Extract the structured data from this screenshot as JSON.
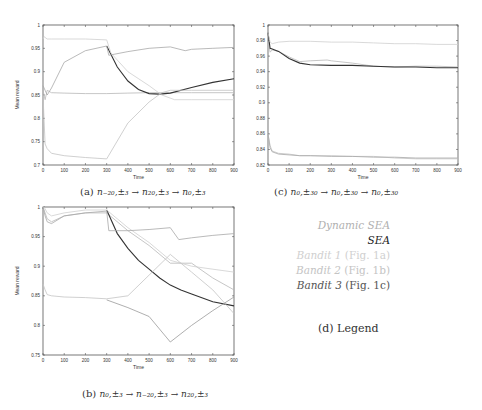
{
  "chart_data": [
    {
      "id": "a",
      "type": "line",
      "caption_label": "(a)",
      "caption_math": "n−20,±3 → n20,±3 → n0,±3",
      "xlabel": "Time",
      "ylabel": "Mean reward",
      "xlim": [
        0,
        900
      ],
      "ylim": [
        0.7,
        1.0
      ],
      "xticks": [
        "0",
        "100",
        "200",
        "300",
        "400",
        "500",
        "600",
        "700",
        "800",
        "900"
      ],
      "yticks": [
        "0.7",
        "0.75",
        "0.8",
        "0.85",
        "0.9",
        "0.95",
        "1"
      ],
      "grid": false,
      "series": [
        {
          "name": "Dynamic SEA",
          "color": "#b8b8b8",
          "x": [
            0,
            10,
            20,
            40,
            100,
            200,
            300,
            400,
            500,
            620,
            700,
            900
          ],
          "y": [
            0.86,
            0.84,
            0.86,
            0.855,
            0.854,
            0.853,
            0.853,
            0.854,
            0.855,
            0.855,
            0.855,
            0.855
          ]
        },
        {
          "name": "SEA",
          "color": "#333333",
          "x": [
            300,
            350,
            400,
            450,
            500,
            550,
            600,
            700,
            800,
            900
          ],
          "y": [
            0.955,
            0.91,
            0.88,
            0.862,
            0.853,
            0.852,
            0.854,
            0.866,
            0.877,
            0.885
          ]
        },
        {
          "name": "Bandit 1 (Fig. 1a)",
          "color": "#cfcfcf",
          "x": [
            0,
            5,
            20,
            40,
            100,
            200,
            300,
            320,
            400,
            500,
            560,
            620,
            700,
            800,
            900
          ],
          "y": [
            0.97,
            0.975,
            0.97,
            0.97,
            0.97,
            0.97,
            0.968,
            0.94,
            0.9,
            0.87,
            0.85,
            0.84,
            0.84,
            0.84,
            0.84
          ]
        },
        {
          "name": "Bandit 2 (Fig. 1b)",
          "color": "#c4c4c4",
          "x": [
            0,
            10,
            20,
            40,
            100,
            200,
            300,
            400,
            500,
            560,
            600,
            700,
            800,
            900
          ],
          "y": [
            0.85,
            0.745,
            0.735,
            0.725,
            0.72,
            0.716,
            0.713,
            0.79,
            0.835,
            0.855,
            0.86,
            0.86,
            0.86,
            0.86
          ]
        },
        {
          "name": "Bandit 3 (Fig. 1c)",
          "color": "#a8a8a8",
          "x": [
            0,
            10,
            20,
            40,
            100,
            200,
            300,
            310,
            400,
            500,
            600,
            670,
            700,
            800,
            900
          ],
          "y": [
            0.87,
            0.86,
            0.85,
            0.865,
            0.92,
            0.945,
            0.955,
            0.935,
            0.943,
            0.95,
            0.953,
            0.945,
            0.948,
            0.95,
            0.952
          ]
        }
      ]
    },
    {
      "id": "b",
      "type": "line",
      "caption_label": "(b)",
      "caption_math": "n0,±3 → n−20,±3 → n20,±3",
      "xlabel": "Time",
      "ylabel": "Mean reward",
      "xlim": [
        0,
        900
      ],
      "ylim": [
        0.75,
        1.0
      ],
      "xticks": [
        "0",
        "100",
        "200",
        "300",
        "400",
        "500",
        "600",
        "700",
        "800",
        "900"
      ],
      "yticks": [
        "0.75",
        "0.8",
        "0.85",
        "0.9",
        "0.95",
        "1"
      ],
      "grid": false,
      "series": [
        {
          "name": "Dynamic SEA",
          "color": "#b8b8b8",
          "x": [
            0,
            10,
            20,
            40,
            100,
            200,
            300,
            400,
            500,
            600,
            700,
            800,
            900
          ],
          "y": [
            1.0,
            0.99,
            0.98,
            0.975,
            0.985,
            0.99,
            0.99,
            0.96,
            0.935,
            0.905,
            0.905,
            0.88,
            0.86
          ]
        },
        {
          "name": "SEA",
          "color": "#333333",
          "x": [
            300,
            350,
            400,
            450,
            500,
            550,
            600,
            650,
            700,
            800,
            900
          ],
          "y": [
            0.995,
            0.955,
            0.93,
            0.91,
            0.895,
            0.88,
            0.868,
            0.86,
            0.853,
            0.84,
            0.833
          ]
        },
        {
          "name": "Bandit 1 (Fig. 1a)",
          "color": "#cfcfcf",
          "x": [
            0,
            5,
            20,
            40,
            100,
            200,
            300,
            350,
            400,
            500,
            600,
            700,
            800,
            900
          ],
          "y": [
            1.0,
            1.0,
            0.99,
            0.985,
            0.99,
            0.995,
            0.995,
            0.98,
            0.965,
            0.94,
            0.91,
            0.9,
            0.895,
            0.89
          ]
        },
        {
          "name": "Bandit 2 (Fig. 1b)",
          "color": "#c4c4c4",
          "x": [
            0,
            10,
            20,
            40,
            100,
            200,
            300,
            400,
            500,
            600,
            700,
            800,
            900
          ],
          "y": [
            0.87,
            0.86,
            0.852,
            0.85,
            0.848,
            0.847,
            0.845,
            0.85,
            0.885,
            0.92,
            0.89,
            0.86,
            0.82
          ]
        },
        {
          "name": "Bandit 3 (Fig. 1c)",
          "color": "#a8a8a8",
          "x": [
            0,
            10,
            20,
            40,
            100,
            200,
            300,
            310,
            400,
            500,
            600,
            640,
            700,
            800,
            900
          ],
          "y": [
            1.0,
            0.985,
            0.975,
            0.972,
            0.985,
            0.99,
            0.993,
            0.96,
            0.96,
            0.962,
            0.965,
            0.945,
            0.948,
            0.952,
            0.955
          ]
        },
        {
          "name": "Bandit 2 decline",
          "color": "#9a9a9a",
          "x": [
            300,
            400,
            500,
            600,
            700,
            800,
            900
          ],
          "y": [
            0.843,
            0.83,
            0.815,
            0.772,
            0.8,
            0.825,
            0.848
          ]
        }
      ]
    },
    {
      "id": "c",
      "type": "line",
      "caption_label": "(c)",
      "caption_math": "n0,±30 → n0,±30 → n0,±30",
      "xlabel": "Time",
      "ylabel": "",
      "xlim": [
        0,
        900
      ],
      "ylim": [
        0.82,
        1.0
      ],
      "xticks": [
        "0",
        "100",
        "200",
        "300",
        "400",
        "500",
        "600",
        "700",
        "800",
        "900"
      ],
      "yticks": [
        "0.82",
        "0.84",
        "0.86",
        "0.88",
        "0.9",
        "0.92",
        "0.94",
        "0.96",
        "0.98",
        "1"
      ],
      "grid": false,
      "series": [
        {
          "name": "Dynamic SEA",
          "color": "#b8b8b8",
          "x": [
            0,
            10,
            20,
            50,
            100,
            150,
            200,
            280,
            300,
            400,
            500,
            600,
            700,
            800,
            900
          ],
          "y": [
            0.98,
            0.965,
            0.968,
            0.966,
            0.959,
            0.953,
            0.954,
            0.955,
            0.954,
            0.951,
            0.947,
            0.946,
            0.947,
            0.947,
            0.946
          ]
        },
        {
          "name": "SEA",
          "color": "#333333",
          "x": [
            0,
            10,
            20,
            50,
            100,
            150,
            200,
            300,
            400,
            500,
            600,
            700,
            800,
            900
          ],
          "y": [
            0.99,
            0.97,
            0.969,
            0.966,
            0.957,
            0.951,
            0.949,
            0.948,
            0.948,
            0.947,
            0.946,
            0.946,
            0.945,
            0.945
          ]
        },
        {
          "name": "Bandit 1 (Fig. 1a)",
          "color": "#cfcfcf",
          "x": [
            0,
            10,
            20,
            50,
            100,
            200,
            300,
            400,
            500,
            600,
            700,
            800,
            900
          ],
          "y": [
            0.99,
            0.978,
            0.976,
            0.978,
            0.979,
            0.979,
            0.978,
            0.978,
            0.977,
            0.976,
            0.976,
            0.975,
            0.975
          ]
        },
        {
          "name": "Bandit 2 (Fig. 1b)",
          "color": "#c4c4c4",
          "x": [
            0,
            10,
            20,
            50,
            100,
            150,
            200,
            300,
            400,
            500,
            600,
            700,
            800,
            900
          ],
          "y": [
            0.86,
            0.845,
            0.838,
            0.835,
            0.834,
            0.832,
            0.832,
            0.832,
            0.831,
            0.831,
            0.829,
            0.828,
            0.828,
            0.828
          ]
        },
        {
          "name": "Bandit 3 (Fig. 1c)",
          "color": "#a8a8a8",
          "x": [
            0,
            10,
            20,
            50,
            100,
            150,
            200,
            300,
            400,
            500,
            600,
            700,
            800,
            900
          ],
          "y": [
            0.86,
            0.842,
            0.837,
            0.834,
            0.833,
            0.832,
            0.832,
            0.831,
            0.831,
            0.83,
            0.83,
            0.829,
            0.829,
            0.829
          ]
        }
      ]
    }
  ],
  "legend": {
    "caption": "(d) Legend",
    "items": [
      {
        "italic": "Dynamic SEA",
        "plain": "",
        "color": "#b0b0b0"
      },
      {
        "italic": "SEA",
        "plain": "",
        "color": "#222222"
      },
      {
        "italic": "Bandit 1",
        "plain": " (Fig. 1a)",
        "color": "#d4d4d4"
      },
      {
        "italic": "Bandit 2",
        "plain": " (Fig. 1b)",
        "color": "#c8c8c8"
      },
      {
        "italic": "Bandit 3",
        "plain": " (Fig. 1c)",
        "color": "#555555"
      }
    ]
  },
  "captions": {
    "a": {
      "label": "(a)",
      "math": "n₋₂₀,±₃ → n₂₀,±₃ → n₀,±₃"
    },
    "b": {
      "label": "(b)",
      "math": "n₀,±₃ → n₋₂₀,±₃ → n₂₀,±₃"
    },
    "c": {
      "label": "(c)",
      "math": "n₀,±₃₀ → n₀,±₃₀ → n₀,±₃₀"
    },
    "d": {
      "label": "(d) Legend"
    }
  }
}
